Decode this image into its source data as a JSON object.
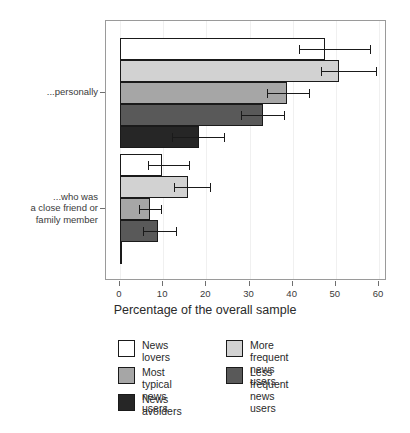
{
  "chart_data": {
    "type": "bar",
    "orientation": "horizontal",
    "title": "",
    "xlabel": "Percentage of the overall sample",
    "ylabel": "",
    "xlim": [
      0,
      60
    ],
    "xticks": [
      0,
      10,
      20,
      30,
      40,
      50,
      60
    ],
    "xticklabels": [
      "0",
      "10",
      "20",
      "30",
      "40",
      "50",
      "60"
    ],
    "grid": true,
    "legend_position": "bottom",
    "categories": [
      "...personally",
      "...who was\na close friend or\nfamily member"
    ],
    "series": [
      {
        "name": "News lovers",
        "color": "#ffffff",
        "values": [
          47.6,
          9.8
        ],
        "err_low": [
          41.5,
          6.5
        ],
        "err_high": [
          58.0,
          16.0
        ]
      },
      {
        "name": "More frequent news users",
        "color": "#d2d2d2",
        "values": [
          50.7,
          15.7
        ],
        "err_low": [
          46.5,
          12.4
        ],
        "err_high": [
          59.2,
          20.8
        ]
      },
      {
        "name": "Most typical news users",
        "color": "#a6a6a6",
        "values": [
          38.8,
          7.0
        ],
        "err_low": [
          34.0,
          4.5
        ],
        "err_high": [
          43.7,
          9.6
        ]
      },
      {
        "name": "Less frequent news users",
        "color": "#595959",
        "values": [
          33.2,
          8.9
        ],
        "err_low": [
          28.0,
          5.3
        ],
        "err_high": [
          38.0,
          13.0
        ]
      },
      {
        "name": "News avoiders",
        "color": "#262626",
        "values": [
          18.2,
          0.4
        ],
        "err_low": [
          12.0,
          0.0
        ],
        "err_high": [
          24.0,
          0.0
        ]
      }
    ]
  },
  "axis": {
    "x_title": "Percentage of the overall sample",
    "tick_labels": [
      "0",
      "10",
      "20",
      "30",
      "40",
      "50",
      "60"
    ],
    "category_labels": [
      "...personally",
      "...who was\na close friend or\nfamily member"
    ]
  },
  "legend": {
    "left_column": [
      {
        "label": "News lovers",
        "color": "#ffffff"
      },
      {
        "label": "Most typical\nnews users",
        "color": "#a6a6a6"
      },
      {
        "label": "News avoiders",
        "color": "#262626"
      }
    ],
    "right_column": [
      {
        "label": "More frequent\nnews users",
        "color": "#d2d2d2"
      },
      {
        "label": "Less frequent\nnews users",
        "color": "#595959"
      }
    ]
  }
}
